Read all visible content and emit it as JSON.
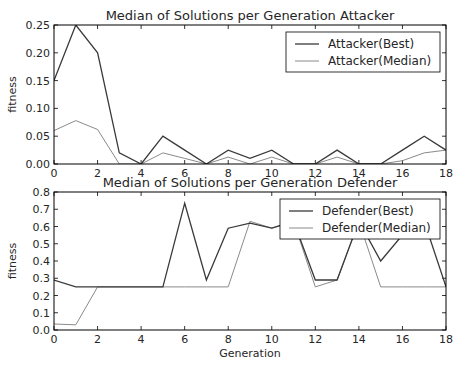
{
  "chart_data": [
    {
      "type": "line",
      "title": "Median of Solutions per Generation Attacker",
      "xlabel": "",
      "ylabel": "fitness",
      "xlim": [
        0,
        18
      ],
      "ylim": [
        0,
        0.25
      ],
      "xticks": [
        "0",
        "2",
        "4",
        "6",
        "8",
        "10",
        "12",
        "14",
        "16",
        "18"
      ],
      "yticks": [
        "0.00",
        "0.05",
        "0.10",
        "0.15",
        "0.20",
        "0.25"
      ],
      "grid": false,
      "legend_position": "upper right",
      "x": [
        0,
        1,
        2,
        3,
        4,
        5,
        6,
        7,
        8,
        9,
        10,
        11,
        12,
        13,
        14,
        15,
        16,
        17,
        18
      ],
      "series": [
        {
          "name": "Attacker(Best)",
          "color": "#3a3a3a",
          "values": [
            0.15,
            0.25,
            0.2,
            0.02,
            0.0,
            0.05,
            0.025,
            0.0,
            0.025,
            0.01,
            0.025,
            0.0,
            0.0,
            0.025,
            0.0,
            0.0,
            0.025,
            0.05,
            0.025
          ]
        },
        {
          "name": "Attacker(Median)",
          "color": "#8a8a8a",
          "values": [
            0.06,
            0.078,
            0.062,
            0.0,
            0.0,
            0.02,
            0.01,
            0.0,
            0.0125,
            0.0,
            0.0125,
            0.0,
            0.0,
            0.0125,
            0.0,
            0.0,
            0.006,
            0.02,
            0.025
          ]
        }
      ]
    },
    {
      "type": "line",
      "title": "Median of Solutions per Generation Defender",
      "xlabel": "Generation",
      "ylabel": "fitness",
      "xlim": [
        0,
        18
      ],
      "ylim": [
        0,
        0.8
      ],
      "xticks": [
        "0",
        "2",
        "4",
        "6",
        "8",
        "10",
        "12",
        "14",
        "16",
        "18"
      ],
      "yticks": [
        "0.0",
        "0.1",
        "0.2",
        "0.3",
        "0.4",
        "0.5",
        "0.6",
        "0.7",
        "0.8"
      ],
      "grid": false,
      "legend_position": "upper right",
      "x": [
        0,
        1,
        2,
        3,
        4,
        5,
        6,
        7,
        8,
        9,
        10,
        11,
        12,
        13,
        14,
        15,
        16,
        17,
        18
      ],
      "series": [
        {
          "name": "Defender(Best)",
          "color": "#3a3a3a",
          "values": [
            0.29,
            0.25,
            0.25,
            0.25,
            0.25,
            0.25,
            0.735,
            0.29,
            0.59,
            0.62,
            0.59,
            0.63,
            0.29,
            0.29,
            0.63,
            0.4,
            0.55,
            0.63,
            0.25
          ]
        },
        {
          "name": "Defender(Median)",
          "color": "#8a8a8a",
          "values": [
            0.035,
            0.03,
            0.25,
            0.25,
            0.25,
            0.25,
            0.25,
            0.25,
            0.25,
            0.63,
            0.59,
            0.63,
            0.25,
            0.29,
            0.63,
            0.25,
            0.25,
            0.25,
            0.25
          ]
        }
      ]
    }
  ],
  "layout": {
    "panels": [
      {
        "left": 54,
        "right": 446,
        "top": 25,
        "bottom": 164,
        "legend": {
          "x": 286,
          "y": 32,
          "w": 154,
          "h": 40
        }
      },
      {
        "left": 54,
        "right": 446,
        "top": 192,
        "bottom": 330,
        "legend": {
          "x": 280,
          "y": 199,
          "w": 160,
          "h": 40
        }
      }
    ]
  }
}
